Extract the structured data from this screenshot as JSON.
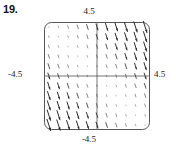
{
  "figure": {
    "problem_number": "19.",
    "caption_top": "4.5",
    "caption_bottom": "-4.5",
    "caption_left": "-4.5",
    "caption_right": "4.5"
  },
  "chart_data": {
    "type": "scatter",
    "subtype": "direction-field",
    "title": "",
    "xlabel": "",
    "ylabel": "",
    "xlim": [
      -4.5,
      4.5
    ],
    "ylim": [
      -4.5,
      4.5
    ],
    "xtick_labels": [
      "-4.5",
      "4.5"
    ],
    "ytick_labels": [
      "-4.5",
      "4.5"
    ],
    "grid": false,
    "legend": null,
    "axes_style": "crosshair-centered",
    "frame": "rounded-rectangle",
    "grid_points_x": 11,
    "grid_points_y": 11,
    "slope_rule": "dy/dx negative; magnitude proportional to |x + y| (or distance from anti-diagonal)",
    "vector_slant": "negative",
    "arrowheads": true,
    "pixel_box": {
      "left": 44,
      "top": 22,
      "right": 150,
      "bottom": 130
    },
    "axis_origin_pixel": {
      "x": 97,
      "y": 76
    }
  }
}
